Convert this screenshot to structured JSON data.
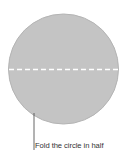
{
  "diagram": {
    "caption": "Fold the circle in half",
    "colors": {
      "circle_fill": "#c4c4c4",
      "circle_stroke": "#b0b0b0",
      "fold_line": "#ffffff",
      "leader_line": "#555555",
      "text": "#333333"
    }
  }
}
